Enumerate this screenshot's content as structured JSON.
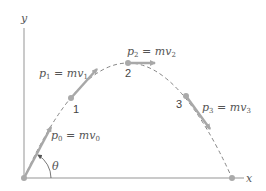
{
  "diagram": {
    "colors": {
      "axis": "#b8b8b8",
      "arrow": "#a8a8a8",
      "dot": "#aaaaaa",
      "trajectory": "#777777",
      "text": "#555555"
    },
    "axes": {
      "x_label": "x",
      "y_label": "y"
    },
    "angle_label": "θ",
    "points": [
      {
        "id": "0",
        "label": "",
        "momentum": {
          "p": "p",
          "sub": "0",
          "eq": " = mv",
          "vsub": "0"
        }
      },
      {
        "id": "1",
        "label": "1",
        "momentum": {
          "p": "p",
          "sub": "1",
          "eq": " = mv",
          "vsub": "1"
        }
      },
      {
        "id": "2",
        "label": "2",
        "momentum": {
          "p": "p",
          "sub": "2",
          "eq": " = mv",
          "vsub": "2"
        }
      },
      {
        "id": "3",
        "label": "3",
        "momentum": {
          "p": "p",
          "sub": "3",
          "eq": " = mv",
          "vsub": "3"
        }
      }
    ]
  }
}
